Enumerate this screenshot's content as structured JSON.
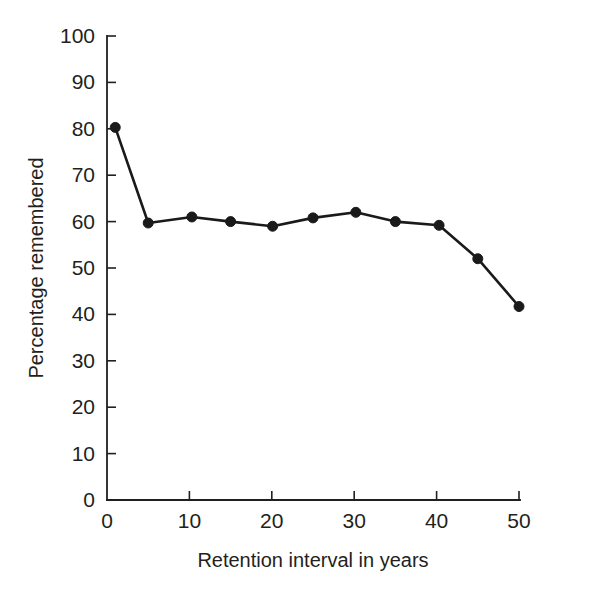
{
  "chart_data": {
    "type": "line",
    "title": "",
    "xlabel": "Retention interval in years",
    "ylabel": "Percentage remembered",
    "xlim": [
      0,
      50
    ],
    "ylim": [
      0,
      100
    ],
    "xticks": [
      0,
      10,
      20,
      30,
      40,
      50
    ],
    "xtick_labels": [
      "0",
      "10",
      "20",
      "30",
      "40",
      "50"
    ],
    "yticks": [
      0,
      10,
      20,
      30,
      40,
      50,
      60,
      70,
      80,
      90,
      100
    ],
    "ytick_labels": [
      "0",
      "10",
      "20",
      "30",
      "40",
      "50",
      "60",
      "70",
      "80",
      "90",
      "100"
    ],
    "grid": false,
    "legend": "none",
    "marker": "filled-circle",
    "line_color": "#1a1a1a",
    "marker_color": "#1a1a1a",
    "background_color": "#ffffff",
    "x": [
      1.0,
      5.0,
      10.3,
      15.0,
      20.1,
      25.0,
      30.2,
      35.0,
      40.3,
      45.0,
      50.0
    ],
    "values": [
      80.3,
      59.7,
      61.0,
      60.0,
      59.0,
      60.8,
      62.0,
      60.0,
      59.2,
      52.0,
      41.7
    ],
    "series": [
      {
        "name": "Percentage remembered",
        "x": [
          1.0,
          5.0,
          10.3,
          15.0,
          20.1,
          25.0,
          30.2,
          35.0,
          40.3,
          45.0,
          50.0
        ],
        "values": [
          80.3,
          59.7,
          61.0,
          60.0,
          59.0,
          60.8,
          62.0,
          60.0,
          59.2,
          52.0,
          41.7
        ]
      }
    ]
  },
  "axes": {
    "x_title": "Retention interval in years",
    "y_title": "Percentage remembered"
  }
}
